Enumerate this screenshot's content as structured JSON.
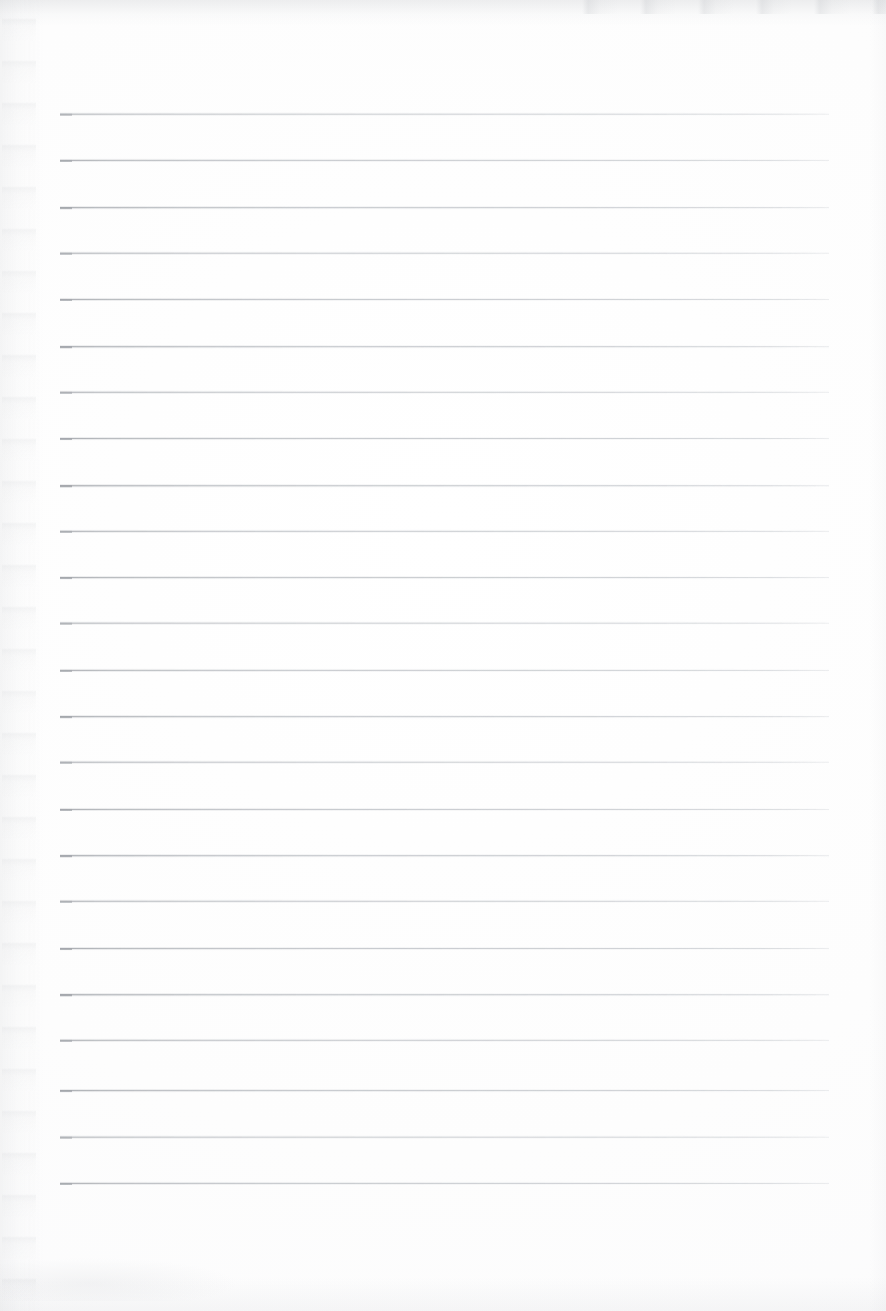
{
  "document": {
    "kind": "scanned-lined-notebook-page",
    "title": "",
    "body_text": "",
    "page_number": "",
    "header_text": "",
    "footer_text": ""
  },
  "page": {
    "width": 886,
    "height": 1311,
    "background_color": "#fefefe",
    "paper_tone": "#fdfdfd"
  },
  "ruling": {
    "line_color": "#b9bdc2",
    "line_color_left_end": "#969a9f",
    "line_thickness": 1,
    "line_count": 24,
    "left_x": 60,
    "right_x": 829,
    "first_line_y": 114,
    "spacing": 46.5,
    "has_vertical_margin_rule": false,
    "line_y_positions": [
      114,
      160,
      207,
      253,
      299,
      346,
      392,
      438,
      485,
      531,
      577,
      623,
      670,
      716,
      762,
      809,
      855,
      901,
      948,
      994,
      1040,
      1090,
      1137,
      1183
    ]
  },
  "artifacts": {
    "left_edge_noise_color": "#c4c6ca",
    "top_edge_noise_color": "#c6c8cc",
    "bottom_edge_noise_color": "#cdcfd3",
    "description": "faint scanner speckle along left margin, top edge band and lower-left corner smudge"
  }
}
